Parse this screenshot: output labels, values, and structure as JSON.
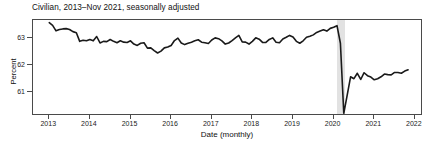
{
  "chart_data": {
    "type": "line",
    "title": "Civilian, 2013–Nov 2021, seasonally adjusted",
    "xlabel": "Date (monthly)",
    "ylabel": "Percent",
    "grid": false,
    "legend": "none",
    "xlim": [
      2012.6,
      2022.2
    ],
    "ylim": [
      60.1,
      63.65
    ],
    "xticks": [
      2013,
      2014,
      2015,
      2016,
      2017,
      2018,
      2019,
      2020,
      2021,
      2022
    ],
    "xtick_labels": [
      "2013",
      "2014",
      "2015",
      "2016",
      "2017",
      "2018",
      "2019",
      "2020",
      "2021",
      "2022"
    ],
    "yticks": [
      61,
      62,
      63
    ],
    "ytick_labels": [
      "61",
      "62",
      "63"
    ],
    "line_color": "#1a1a1a",
    "line_width": 1.6,
    "shaded_region": {
      "label": "recession",
      "color": "#e2e2e2",
      "x_start": 2020.08,
      "x_end": 2020.28
    },
    "series": [
      {
        "name": "Civilian labor force participation rate",
        "x": [
          2013.0,
          2013.083,
          2013.167,
          2013.25,
          2013.333,
          2013.417,
          2013.5,
          2013.583,
          2013.667,
          2013.75,
          2013.833,
          2013.917,
          2014.0,
          2014.083,
          2014.167,
          2014.25,
          2014.333,
          2014.417,
          2014.5,
          2014.583,
          2014.667,
          2014.75,
          2014.833,
          2014.917,
          2015.0,
          2015.083,
          2015.167,
          2015.25,
          2015.333,
          2015.417,
          2015.5,
          2015.583,
          2015.667,
          2015.75,
          2015.833,
          2015.917,
          2016.0,
          2016.083,
          2016.167,
          2016.25,
          2016.333,
          2016.417,
          2016.5,
          2016.583,
          2016.667,
          2016.75,
          2016.833,
          2016.917,
          2017.0,
          2017.083,
          2017.167,
          2017.25,
          2017.333,
          2017.417,
          2017.5,
          2017.583,
          2017.667,
          2017.75,
          2017.833,
          2017.917,
          2018.0,
          2018.083,
          2018.167,
          2018.25,
          2018.333,
          2018.417,
          2018.5,
          2018.583,
          2018.667,
          2018.75,
          2018.833,
          2018.917,
          2019.0,
          2019.083,
          2019.167,
          2019.25,
          2019.333,
          2019.417,
          2019.5,
          2019.583,
          2019.667,
          2019.75,
          2019.833,
          2019.917,
          2020.0,
          2020.083,
          2020.167,
          2020.25,
          2020.333,
          2020.417,
          2020.5,
          2020.583,
          2020.667,
          2020.75,
          2020.833,
          2020.917,
          2021.0,
          2021.083,
          2021.167,
          2021.25,
          2021.333,
          2021.417,
          2021.5,
          2021.583,
          2021.667,
          2021.75,
          2021.833
        ],
        "values": [
          63.55,
          63.45,
          63.25,
          63.3,
          63.32,
          63.33,
          63.3,
          63.22,
          63.18,
          62.86,
          62.9,
          62.88,
          62.93,
          62.88,
          63.04,
          62.8,
          62.86,
          62.85,
          62.93,
          62.86,
          62.81,
          62.88,
          62.83,
          62.82,
          62.88,
          62.76,
          62.71,
          62.79,
          62.81,
          62.61,
          62.62,
          62.52,
          62.43,
          62.5,
          62.62,
          62.65,
          62.71,
          62.89,
          62.98,
          62.8,
          62.74,
          62.79,
          62.83,
          62.88,
          62.92,
          62.83,
          62.81,
          62.78,
          62.91,
          62.99,
          62.96,
          62.88,
          62.76,
          62.8,
          62.89,
          62.99,
          63.08,
          62.84,
          62.83,
          62.76,
          62.86,
          62.99,
          62.94,
          62.82,
          62.82,
          62.93,
          62.99,
          62.83,
          62.81,
          62.95,
          63.01,
          63.08,
          63.02,
          62.86,
          62.79,
          62.88,
          63.01,
          63.05,
          63.1,
          63.19,
          63.24,
          63.29,
          63.24,
          63.34,
          63.38,
          63.44,
          62.79,
          60.2,
          60.86,
          61.55,
          61.48,
          61.68,
          61.45,
          61.7,
          61.59,
          61.54,
          61.44,
          61.48,
          61.55,
          61.65,
          61.63,
          61.62,
          61.71,
          61.71,
          61.68,
          61.76,
          61.81
        ]
      }
    ]
  }
}
